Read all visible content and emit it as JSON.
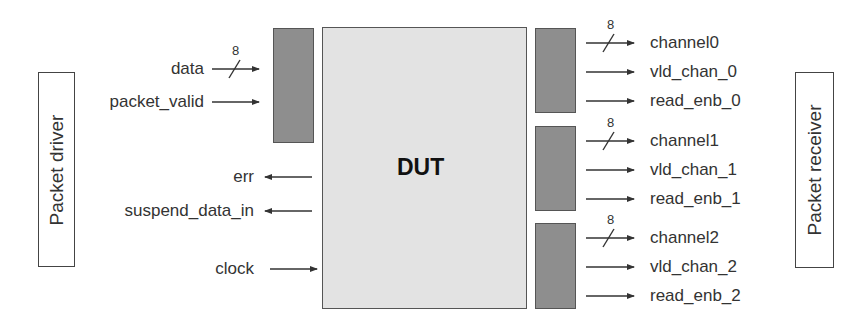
{
  "diagram": {
    "type": "block-diagram",
    "dut": {
      "label": "DUT"
    },
    "driver": {
      "label": "Packet driver"
    },
    "receiver": {
      "label": "Packet receiver"
    },
    "colors": {
      "dut_fill": "#e3e3e3",
      "register_fill": "#8e8e8e",
      "line": "#333333"
    },
    "inputs": [
      {
        "name": "data",
        "direction": "in",
        "bus_width": "8"
      },
      {
        "name": "packet_valid",
        "direction": "in"
      }
    ],
    "status_outputs": [
      {
        "name": "err",
        "direction": "out"
      },
      {
        "name": "suspend_data_in",
        "direction": "out"
      }
    ],
    "clock": {
      "name": "clock",
      "direction": "in"
    },
    "channels": [
      {
        "signals": [
          {
            "name": "channel0",
            "bus_width": "8"
          },
          {
            "name": "vld_chan_0"
          },
          {
            "name": "read_enb_0"
          }
        ]
      },
      {
        "signals": [
          {
            "name": "channel1",
            "bus_width": "8"
          },
          {
            "name": "vld_chan_1"
          },
          {
            "name": "read_enb_1"
          }
        ]
      },
      {
        "signals": [
          {
            "name": "channel2",
            "bus_width": "8"
          },
          {
            "name": "vld_chan_2"
          },
          {
            "name": "read_enb_2"
          }
        ]
      }
    ]
  }
}
